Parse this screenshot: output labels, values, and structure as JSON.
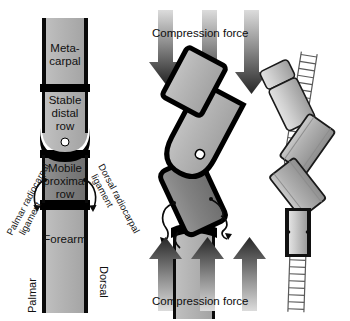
{
  "figure": {
    "background_color": "#ffffff",
    "panels": [
      {
        "id": "anatomy-column",
        "name": "Neutral wrist column with labeled segments"
      },
      {
        "id": "buckling-column",
        "name": "Compressed buckling wrist column"
      },
      {
        "id": "spring-analogy",
        "name": "Spring and block mechanical analogy"
      }
    ]
  },
  "left_panel": {
    "segments": [
      {
        "key": "metacarpal",
        "line1": "Meta-",
        "line2": "carpal",
        "fill": "#b4b4b4"
      },
      {
        "key": "stable-distal-row",
        "line1": "Stable",
        "line2": "distal",
        "line3": "row",
        "fill": "#b0b0b0"
      },
      {
        "key": "mobile-proximal-row",
        "line1": "Mobile",
        "line2": "proximal",
        "line3": "row",
        "fill": "#8a8a8a"
      },
      {
        "key": "forearm",
        "line1": "Forearm",
        "fill": "#b4b4b4"
      }
    ],
    "ligaments": [
      {
        "key": "palmar-radiocarpal-ligament",
        "line1": "Palmar radiocarpal",
        "line2": "ligament"
      },
      {
        "key": "dorsal-radiocarpal-ligament",
        "line1": "Dorsal radiocarpal",
        "line2": "ligament"
      }
    ],
    "orientation": {
      "palmar": "Palmar",
      "dorsal": "Dorsal"
    },
    "pivot_marker_color": "#ffffff"
  },
  "middle_panel": {
    "force_label_top": "Compression force",
    "force_label_bottom": "Compression force",
    "arrow_count_top": 3,
    "arrow_count_bottom": 3,
    "arrow_direction_top": "down",
    "arrow_direction_bottom": "up",
    "segment_fills": {
      "metacarpal": "#b0b0b0",
      "distal_row": "#a8a8a8",
      "proximal_row": "#787878",
      "forearm": "#b0b0b0"
    },
    "pivot_marker_color": "#ffffff"
  },
  "right_panel": {
    "description": "Zigzag spring with three rigid blocks",
    "spring_color": "#6f6f6f",
    "block_fills": [
      "#d2d2d2",
      "#b8b8b8",
      "#b8b8b8",
      "#c6c6c6"
    ],
    "block_count": 4
  },
  "colors": {
    "outline": "#000000",
    "light_gray": "#b4b4b4",
    "mid_gray": "#8a8a8a",
    "dark_gray": "#787878",
    "arrow_dark": "#2b2b2b",
    "arrow_light": "#d6d6d6",
    "white": "#ffffff"
  }
}
